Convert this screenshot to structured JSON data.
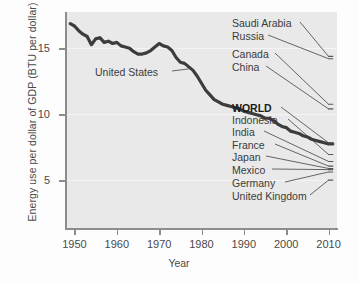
{
  "chart_data": {
    "type": "line",
    "title": "",
    "xlabel": "Year",
    "ylabel": "Energy use per dollar of GDP (BTU per dollar)",
    "xlim": [
      1948,
      2012
    ],
    "ylim": [
      0,
      18.5
    ],
    "xticks": [
      1950,
      1960,
      1970,
      1980,
      1990,
      2000,
      2010
    ],
    "xticklabels": [
      "1950",
      "1960",
      "1970",
      "1980",
      "1990",
      "2000",
      "2010"
    ],
    "yticks": [
      5,
      10,
      15
    ],
    "yticklabels": [
      "5",
      "10",
      "15"
    ],
    "grid": "horizontal-faint",
    "legend": "inline-right-labels",
    "series": [
      {
        "name": "United States",
        "emphasis": "heavy",
        "x": [
          1949,
          1950,
          1951,
          1952,
          1953,
          1954,
          1955,
          1956,
          1957,
          1958,
          1959,
          1960,
          1961,
          1962,
          1963,
          1964,
          1965,
          1966,
          1967,
          1968,
          1969,
          1970,
          1971,
          1972,
          1973,
          1974,
          1975,
          1976,
          1977,
          1978,
          1979,
          1980,
          1981,
          1982,
          1983,
          1984,
          1985,
          1986,
          1987,
          1988,
          1989,
          1990,
          1991,
          1992,
          1993,
          1994,
          1995,
          1996,
          1997,
          1998,
          1999,
          2000,
          2001,
          2002,
          2003,
          2004,
          2005,
          2006,
          2007,
          2008,
          2009,
          2010,
          2011
        ],
        "y": [
          17.5,
          17.3,
          16.9,
          16.6,
          16.4,
          15.7,
          16.2,
          16.3,
          15.9,
          16.0,
          15.8,
          15.9,
          15.6,
          15.5,
          15.4,
          15.1,
          14.9,
          14.9,
          15.0,
          15.2,
          15.5,
          15.8,
          15.6,
          15.5,
          15.2,
          14.6,
          14.2,
          14.1,
          13.8,
          13.5,
          13.0,
          12.4,
          11.8,
          11.4,
          11.0,
          10.8,
          10.6,
          10.5,
          10.4,
          10.3,
          10.2,
          10.0,
          9.9,
          9.8,
          9.7,
          9.6,
          9.4,
          9.4,
          9.2,
          8.9,
          8.7,
          8.6,
          8.3,
          8.2,
          8.1,
          7.9,
          7.8,
          7.6,
          7.5,
          7.4,
          7.3,
          7.2,
          7.2
        ]
      },
      {
        "name": "Saudi Arabia",
        "x": [
          2010,
          2011
        ],
        "y": [
          14.7,
          14.7
        ]
      },
      {
        "name": "Russia",
        "x": [
          2010,
          2011
        ],
        "y": [
          14.5,
          14.5
        ]
      },
      {
        "name": "Canada",
        "x": [
          2010,
          2011
        ],
        "y": [
          10.6,
          10.6
        ]
      },
      {
        "name": "China",
        "x": [
          2010,
          2011
        ],
        "y": [
          10.2,
          10.2
        ]
      },
      {
        "name": "WORLD",
        "x": [
          2010,
          2011
        ],
        "y": [
          7.3,
          7.3
        ]
      },
      {
        "name": "Indonesia",
        "x": [
          2010,
          2011
        ],
        "y": [
          6.3,
          6.3
        ]
      },
      {
        "name": "India",
        "x": [
          2010,
          2011
        ],
        "y": [
          5.7,
          5.7
        ]
      },
      {
        "name": "France",
        "x": [
          2010,
          2011
        ],
        "y": [
          5.3,
          5.3
        ]
      },
      {
        "name": "Japan",
        "x": [
          2010,
          2011
        ],
        "y": [
          5.1,
          5.1
        ]
      },
      {
        "name": "Mexico",
        "x": [
          2010,
          2011
        ],
        "y": [
          5.0,
          5.0
        ]
      },
      {
        "name": "Germany",
        "x": [
          2010,
          2011
        ],
        "y": [
          4.8,
          4.8
        ]
      },
      {
        "name": "United Kingdom",
        "x": [
          2010,
          2011
        ],
        "y": [
          4.1,
          4.1
        ]
      }
    ],
    "annotations": [
      {
        "text": "United States",
        "x": 1962,
        "y": 12.6
      },
      {
        "text": "Saudi Arabia",
        "x": 1991,
        "y": 17.6
      },
      {
        "text": "Russia",
        "x": 1991,
        "y": 16.6
      },
      {
        "text": "Canada",
        "x": 1991,
        "y": 15.2
      },
      {
        "text": "China",
        "x": 1991,
        "y": 14.2
      },
      {
        "text": "WORLD",
        "x": 1991,
        "y": 11.3
      },
      {
        "text": "Indonesia",
        "x": 1991,
        "y": 10.4
      },
      {
        "text": "India",
        "x": 1991,
        "y": 9.5
      },
      {
        "text": "France",
        "x": 1991,
        "y": 8.5
      },
      {
        "text": "Japan",
        "x": 1991,
        "y": 7.6
      },
      {
        "text": "Mexico",
        "x": 1991,
        "y": 6.6
      },
      {
        "text": "Germany",
        "x": 1991,
        "y": 5.7
      },
      {
        "text": "United Kingdom",
        "x": 1991,
        "y": 4.7
      }
    ]
  },
  "axes": {
    "ylabel": "Energy use per dollar of GDP (BTU per dollar)",
    "xlabel": "Year",
    "yticklabels": [
      "15",
      "10",
      "5"
    ],
    "xticklabels": [
      "1950",
      "1960",
      "1970",
      "1980",
      "1990",
      "2000",
      "2010"
    ]
  },
  "labels": {
    "united_states": "United States",
    "saudi_arabia": "Saudi Arabia",
    "russia": "Russia",
    "canada": "Canada",
    "china": "China",
    "world": "WORLD",
    "indonesia": "Indonesia",
    "india": "India",
    "france": "France",
    "japan": "Japan",
    "mexico": "Mexico",
    "germany": "Germany",
    "united_kingdom": "United Kingdom"
  },
  "colors": {
    "plot_background": "#e9e9e9",
    "page_background": "#fdfdfd",
    "axis": "#8c8c8c",
    "gridline": "#f4f4f4",
    "us_line": "#3c3c3c",
    "country_line": "#555555",
    "text": "#3b3b3b",
    "bold_text": "#1a1a1a"
  }
}
